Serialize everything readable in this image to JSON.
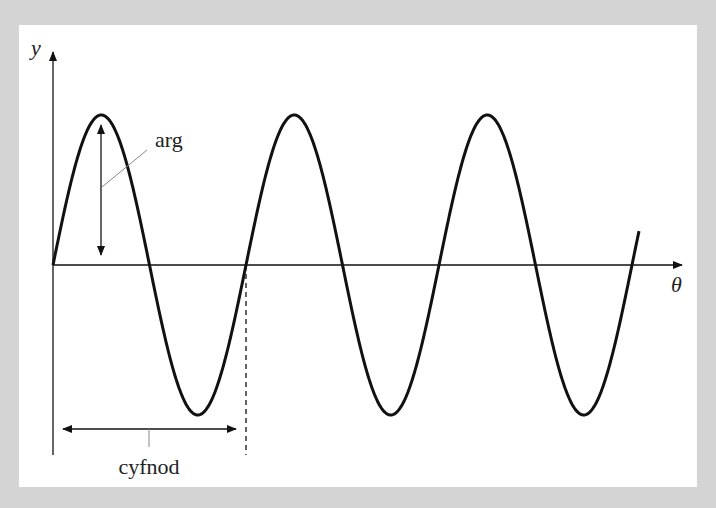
{
  "diagram": {
    "axes": {
      "y_label": "y",
      "x_label": "θ"
    },
    "annotations": {
      "amplitude_label": "arg",
      "period_label": "cyfnod"
    },
    "colors": {
      "background": "#d4d4d4",
      "panel": "#ffffff",
      "stroke": "#111111",
      "leader": "#888888"
    }
  },
  "chart_data": {
    "type": "line",
    "title": "",
    "xlabel": "θ",
    "ylabel": "y",
    "function": "y = A·sin(θ)",
    "periods_shown": 3,
    "annotations": [
      "arg (amplitude)",
      "cyfnod (period)"
    ],
    "grid": false
  }
}
